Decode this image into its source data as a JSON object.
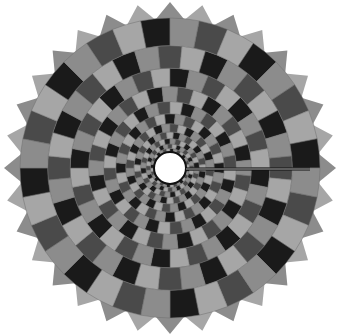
{
  "figure": {
    "width": 340,
    "height": 335,
    "background": "#ffffff",
    "center": {
      "x": 170,
      "y": 168
    },
    "sectors": 32,
    "rings": 11,
    "inner_radius": 16,
    "outer_radius": 150,
    "tooth_radius": 166,
    "twist_per_ring": 0.5,
    "palette": [
      "#1a1a1a",
      "#8c8c8c",
      "#4a4a4a",
      "#a6a6a6"
    ],
    "cell_stroke": "#6e6e6e",
    "center_hole": {
      "fill": "#ffffff",
      "stroke": "#111111",
      "stroke_width": 2
    },
    "radial_line": {
      "from_x": 186,
      "to_x": 340,
      "y": 169,
      "color": "#111111",
      "highlight": "#d0d0d0",
      "width": 2
    }
  }
}
